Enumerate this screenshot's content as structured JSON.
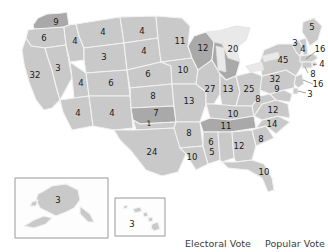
{
  "map": {
    "title": "United States electoral vote map",
    "colors": {
      "state_light": "#c9c9c9",
      "state_dark": "#a9a9a9",
      "state_mid": "#bcbcbc",
      "border": "#f2f2f2",
      "lake": "#e9e9e9",
      "inset_border": "#9a9a9a",
      "label_text": "#1a1a1a"
    },
    "states": [
      {
        "code": "WA",
        "name": "Washington",
        "votes": "9",
        "shade": "dark"
      },
      {
        "code": "OR",
        "name": "Oregon",
        "votes": "6",
        "shade": "light"
      },
      {
        "code": "CA",
        "name": "California",
        "votes": "32",
        "shade": "light"
      },
      {
        "code": "NV",
        "name": "Nevada",
        "votes": "3",
        "shade": "light"
      },
      {
        "code": "ID",
        "name": "Idaho",
        "votes": "4",
        "shade": "light"
      },
      {
        "code": "MT",
        "name": "Montana",
        "votes": "4",
        "shade": "light"
      },
      {
        "code": "WY",
        "name": "Wyoming",
        "votes": "3",
        "shade": "light"
      },
      {
        "code": "UT",
        "name": "Utah",
        "votes": "4",
        "shade": "light"
      },
      {
        "code": "AZ",
        "name": "Arizona",
        "votes": "4",
        "shade": "light"
      },
      {
        "code": "CO",
        "name": "Colorado",
        "votes": "6",
        "shade": "light"
      },
      {
        "code": "NM",
        "name": "New Mexico",
        "votes": "4",
        "shade": "light"
      },
      {
        "code": "ND",
        "name": "North Dakota",
        "votes": "4",
        "shade": "light"
      },
      {
        "code": "SD",
        "name": "South Dakota",
        "votes": "4",
        "shade": "light"
      },
      {
        "code": "NE",
        "name": "Nebraska",
        "votes": "6",
        "shade": "light"
      },
      {
        "code": "KS",
        "name": "Kansas",
        "votes": "8",
        "shade": "light"
      },
      {
        "code": "OK",
        "name": "Oklahoma",
        "votes": "7",
        "shade": "dark"
      },
      {
        "code": "OK2",
        "name": "Oklahoma split",
        "votes": "1",
        "shade": "light"
      },
      {
        "code": "TX",
        "name": "Texas",
        "votes": "24",
        "shade": "light"
      },
      {
        "code": "MN",
        "name": "Minnesota",
        "votes": "11",
        "shade": "light"
      },
      {
        "code": "IA",
        "name": "Iowa",
        "votes": "10",
        "shade": "light"
      },
      {
        "code": "MO",
        "name": "Missouri",
        "votes": "13",
        "shade": "light"
      },
      {
        "code": "AR",
        "name": "Arkansas",
        "votes": "8",
        "shade": "light"
      },
      {
        "code": "LA",
        "name": "Louisiana",
        "votes": "10",
        "shade": "light"
      },
      {
        "code": "WI",
        "name": "Wisconsin",
        "votes": "12",
        "shade": "dark"
      },
      {
        "code": "IL",
        "name": "Illinois",
        "votes": "27",
        "shade": "light"
      },
      {
        "code": "MI",
        "name": "Michigan",
        "votes": "20",
        "shade": "dark"
      },
      {
        "code": "IN",
        "name": "Indiana",
        "votes": "13",
        "shade": "light"
      },
      {
        "code": "OH",
        "name": "Ohio",
        "votes": "25",
        "shade": "light"
      },
      {
        "code": "KY",
        "name": "Kentucky",
        "votes": "10",
        "shade": "light"
      },
      {
        "code": "TN",
        "name": "Tennessee",
        "votes": "11",
        "shade": "dark"
      },
      {
        "code": "MS",
        "name": "Mississippi",
        "votes": "6",
        "shade": "light"
      },
      {
        "code": "AL",
        "name": "Alabama",
        "votes": "5",
        "shade": "light"
      },
      {
        "code": "GA",
        "name": "Georgia",
        "votes": "12",
        "shade": "light"
      },
      {
        "code": "FL",
        "name": "Florida",
        "votes": "10",
        "shade": "light"
      },
      {
        "code": "SC",
        "name": "South Carolina",
        "votes": "8",
        "shade": "light"
      },
      {
        "code": "NC",
        "name": "North Carolina",
        "votes": "14",
        "shade": "light"
      },
      {
        "code": "VA",
        "name": "Virginia",
        "votes": "12",
        "shade": "light"
      },
      {
        "code": "WV",
        "name": "West Virginia",
        "votes": "8",
        "shade": "light"
      },
      {
        "code": "MD",
        "name": "Maryland",
        "votes": "9",
        "shade": "light"
      },
      {
        "code": "PA",
        "name": "Pennsylvania",
        "votes": "32",
        "shade": "light"
      },
      {
        "code": "NY",
        "name": "New York",
        "votes": "45",
        "shade": "light"
      },
      {
        "code": "VT",
        "name": "Vermont",
        "votes": "3",
        "shade": "light"
      },
      {
        "code": "NH",
        "name": "New Hampshire",
        "votes": "4",
        "shade": "light"
      },
      {
        "code": "ME",
        "name": "Maine",
        "votes": "5",
        "shade": "light"
      },
      {
        "code": "MA",
        "name": "Massachusetts",
        "votes": "16",
        "shade": "light"
      },
      {
        "code": "RI",
        "name": "Rhode Island",
        "votes": "4",
        "shade": "light"
      },
      {
        "code": "CT",
        "name": "Connecticut",
        "votes": "8",
        "shade": "light"
      },
      {
        "code": "NJ",
        "name": "New Jersey",
        "votes": "16",
        "shade": "light"
      },
      {
        "code": "DE",
        "name": "Delaware",
        "votes": "3",
        "shade": "light"
      },
      {
        "code": "AK",
        "name": "Alaska",
        "votes": "3",
        "shade": "light"
      },
      {
        "code": "HI",
        "name": "Hawaii",
        "votes": "3",
        "shade": "light"
      }
    ]
  },
  "footer": {
    "electoral_vote_label": "Electoral Vote",
    "popular_vote_label": "Popular Vote"
  }
}
